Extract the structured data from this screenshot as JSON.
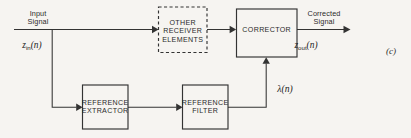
{
  "figure": {
    "panel_tag": "(c)",
    "background_color": "#f6f4f1",
    "line_color": "#333333",
    "text_color": "#2b2b2b"
  },
  "inputs": {
    "input_caption_line1": "Input",
    "input_caption_line2": "Signal",
    "input_symbol_base": "z",
    "input_symbol_sub": "in",
    "input_symbol_arg": "(n)"
  },
  "outputs": {
    "output_caption_line1": "Corrected",
    "output_caption_line2": "Signal",
    "output_symbol_base": "z",
    "output_symbol_sub": "out",
    "output_symbol_arg": "(n)"
  },
  "signals": {
    "feedback_label": "λ(n)"
  },
  "blocks": [
    {
      "id": "other-receiver-elements",
      "lines": [
        "OTHER",
        "RECEIVER",
        "ELEMENTS"
      ],
      "border": "dashed"
    },
    {
      "id": "corrector",
      "lines": [
        "CORRECTOR"
      ],
      "border": "solid"
    },
    {
      "id": "reference-extractor",
      "lines": [
        "REFERENCE",
        "EXTRACTOR"
      ],
      "border": "solid"
    },
    {
      "id": "reference-filter",
      "lines": [
        "REFERENCE",
        "FILTER"
      ],
      "border": "solid"
    }
  ]
}
